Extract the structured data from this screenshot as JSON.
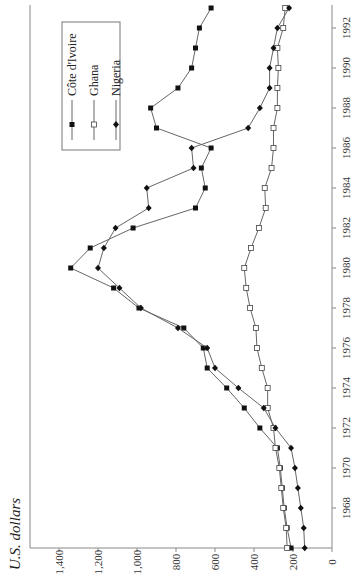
{
  "chart_data": {
    "type": "line",
    "rotation": "rotated 90 degrees counter-clockwise",
    "title": "",
    "ylabel": "U.S. dollars",
    "xlabel": "",
    "x": [
      1966,
      1967,
      1968,
      1969,
      1970,
      1971,
      1972,
      1973,
      1974,
      1975,
      1976,
      1977,
      1978,
      1979,
      1980,
      1981,
      1982,
      1983,
      1984,
      1985,
      1986,
      1987,
      1988,
      1989,
      1990,
      1991,
      1992,
      1993
    ],
    "x_ticks": [
      "1968",
      "1970",
      "1972",
      "1974",
      "1976",
      "1978",
      "1980",
      "1982",
      "1984",
      "1986",
      "1988",
      "1990",
      "1992"
    ],
    "y_ticks": [
      "0",
      "200",
      "400",
      "600",
      "800",
      "1,000",
      "1,200",
      "1,400"
    ],
    "ylim": [
      0,
      1400
    ],
    "grid": false,
    "legend_position": "upper-left (rotated view)",
    "series": [
      {
        "name": "Côte d'Ivoire",
        "marker": "filled-square",
        "values": [
          210,
          230,
          245,
          255,
          265,
          280,
          370,
          450,
          540,
          640,
          660,
          760,
          990,
          1120,
          1340,
          1240,
          1020,
          700,
          650,
          670,
          620,
          900,
          930,
          790,
          720,
          700,
          680,
          620
        ]
      },
      {
        "name": "Ghana",
        "marker": "open-square",
        "values": [
          230,
          235,
          250,
          260,
          270,
          290,
          300,
          330,
          330,
          360,
          385,
          390,
          420,
          440,
          450,
          415,
          375,
          340,
          345,
          310,
          300,
          300,
          280,
          280,
          275,
          280,
          250,
          240
        ]
      },
      {
        "name": "Nigeria",
        "marker": "filled-diamond",
        "values": [
          140,
          145,
          160,
          175,
          190,
          210,
          290,
          350,
          480,
          600,
          640,
          790,
          980,
          1090,
          1200,
          1170,
          1110,
          940,
          950,
          710,
          720,
          430,
          370,
          320,
          320,
          300,
          280,
          220
        ]
      }
    ]
  },
  "axis": {
    "unit_label": "U.S. dollars",
    "y_tick_labels": [
      "1,400",
      "1,200",
      "1,000",
      "800",
      "600",
      "400",
      "200",
      "0"
    ],
    "x_tick_labels": [
      "1992",
      "1990",
      "1988",
      "1986",
      "1984",
      "1982",
      "1980",
      "1978",
      "1976",
      "1974",
      "1972",
      "1970",
      "1968"
    ]
  },
  "legend": {
    "items": [
      {
        "label": "Côte d'Ivoire"
      },
      {
        "label": "Ghana"
      },
      {
        "label": "Nigeria"
      }
    ]
  }
}
